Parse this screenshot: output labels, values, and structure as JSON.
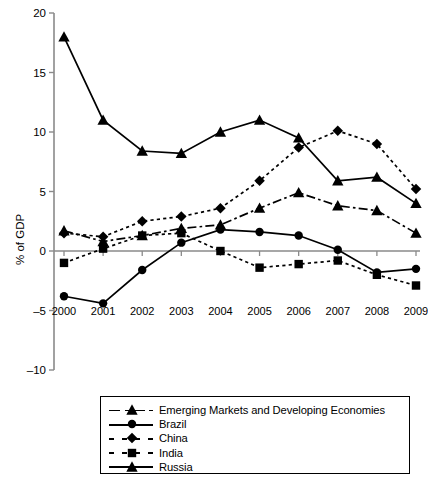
{
  "chart_data": {
    "type": "line",
    "title": "",
    "xlabel": "",
    "ylabel": "% of GDP",
    "x": [
      2000,
      2001,
      2002,
      2003,
      2004,
      2005,
      2006,
      2007,
      2008,
      2009
    ],
    "categories": [
      "2000",
      "2001",
      "2002",
      "2003",
      "2004",
      "2005",
      "2006",
      "2007",
      "2008",
      "2009"
    ],
    "ylim": [
      -10,
      20
    ],
    "yticks": [
      -10,
      -5,
      0,
      5,
      10,
      15,
      20
    ],
    "ytick_labels": [
      "–10",
      "–5",
      "0",
      "5",
      "10",
      "15",
      "20"
    ],
    "grid": false,
    "zero_line": true,
    "legend_position": "bottom",
    "series": [
      {
        "name": "Emerging Markets and Developing Economies",
        "marker": "triangle",
        "line_style": "dash-dot",
        "values": [
          1.7,
          0.8,
          1.3,
          1.9,
          2.2,
          3.6,
          4.9,
          3.8,
          3.4,
          1.5
        ]
      },
      {
        "name": "Brazil",
        "marker": "circle",
        "line_style": "solid",
        "values": [
          -3.8,
          -4.4,
          -1.6,
          0.7,
          1.8,
          1.6,
          1.3,
          0.1,
          -1.8,
          -1.5
        ]
      },
      {
        "name": "China",
        "marker": "diamond",
        "line_style": "dotted",
        "values": [
          1.5,
          1.2,
          2.5,
          2.9,
          3.6,
          5.9,
          8.7,
          10.1,
          9.0,
          5.2
        ]
      },
      {
        "name": "India",
        "marker": "square",
        "line_style": "dotted",
        "values": [
          -1.0,
          0.2,
          1.3,
          1.5,
          0.0,
          -1.4,
          -1.1,
          -0.8,
          -2.0,
          -2.9
        ]
      },
      {
        "name": "Russia",
        "marker": "triangle",
        "line_style": "solid",
        "values": [
          18.0,
          11.0,
          8.4,
          8.2,
          10.0,
          11.0,
          9.5,
          5.9,
          6.2,
          4.0
        ]
      }
    ]
  },
  "legend": {
    "items": [
      {
        "label": "Emerging Markets and Developing Economies",
        "marker": "triangle",
        "style": "dashdot"
      },
      {
        "label": "Brazil",
        "marker": "circle",
        "style": "solid"
      },
      {
        "label": "China",
        "marker": "diamond",
        "style": "dotted"
      },
      {
        "label": "India",
        "marker": "square",
        "style": "dotted"
      },
      {
        "label": "Russia",
        "marker": "triangle",
        "style": "solid"
      }
    ]
  }
}
